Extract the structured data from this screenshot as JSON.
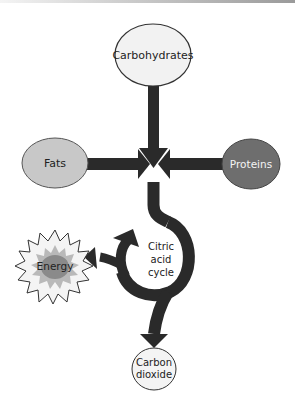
{
  "diagram": {
    "nodes": {
      "carbohydrates": {
        "label": "Carbohydrates",
        "fill": "#f2f2f2"
      },
      "fats": {
        "label": "Fats",
        "fill": "#c8c8c8"
      },
      "proteins": {
        "label": "Proteins",
        "fill": "#6e6e6e"
      },
      "energy": {
        "label": "Energy",
        "fill_outer": "#f4f4f4",
        "fill_mid": "#b9b9b9",
        "fill_inner": "#8a8a8a"
      },
      "cycle": {
        "line1": "Citric",
        "line2": "acid",
        "line3": "cycle"
      },
      "carbon_dioxide": {
        "line1": "Carbon",
        "line2": "dioxide",
        "fill": "#f4f4f4"
      }
    },
    "edges": [
      {
        "from": "Carbohydrates",
        "to": "center"
      },
      {
        "from": "Fats",
        "to": "center"
      },
      {
        "from": "Proteins",
        "to": "center"
      },
      {
        "from": "center",
        "to": "Citric acid cycle"
      },
      {
        "from": "Citric acid cycle",
        "to": "Energy"
      },
      {
        "from": "Citric acid cycle",
        "to": "Carbon dioxide"
      }
    ],
    "arrow_color": "#2a2a2a"
  }
}
